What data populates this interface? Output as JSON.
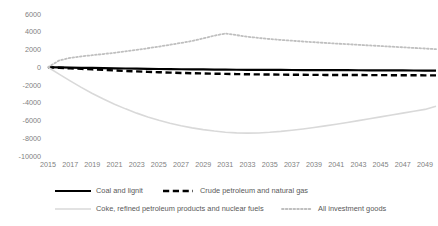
{
  "chart_data": {
    "type": "line",
    "title": "",
    "xlabel": "",
    "ylabel": "",
    "xlim": [
      2015,
      2050
    ],
    "ylim": [
      -10000,
      6000
    ],
    "grid": false,
    "legend_position": "bottom",
    "yticks": [
      6000,
      4000,
      2000,
      0,
      -2000,
      -4000,
      -6000,
      -8000,
      -10000
    ],
    "xticks": [
      2015,
      2017,
      2019,
      2021,
      2023,
      2025,
      2027,
      2029,
      2031,
      2033,
      2035,
      2037,
      2039,
      2041,
      2043,
      2045,
      2047,
      2049
    ],
    "x": [
      2015,
      2016,
      2017,
      2018,
      2019,
      2020,
      2021,
      2022,
      2023,
      2024,
      2025,
      2026,
      2027,
      2028,
      2029,
      2030,
      2031,
      2032,
      2033,
      2034,
      2035,
      2036,
      2037,
      2038,
      2039,
      2040,
      2041,
      2042,
      2043,
      2044,
      2045,
      2046,
      2047,
      2048,
      2049,
      2050
    ],
    "series": [
      {
        "name": "Coal and lignit",
        "style": "solid",
        "color": "#000000",
        "width": 2.2,
        "values": [
          0,
          -20,
          -40,
          -60,
          -80,
          -100,
          -120,
          -140,
          -160,
          -180,
          -195,
          -210,
          -225,
          -240,
          -250,
          -260,
          -270,
          -280,
          -290,
          -295,
          -300,
          -305,
          -310,
          -315,
          -320,
          -325,
          -330,
          -335,
          -340,
          -345,
          -350,
          -355,
          -360,
          -365,
          -370,
          -375
        ]
      },
      {
        "name": "Crude petroleum and natural gas",
        "style": "dashed",
        "color": "#000000",
        "width": 2.4,
        "values": [
          0,
          -60,
          -120,
          -180,
          -240,
          -300,
          -360,
          -420,
          -470,
          -520,
          -560,
          -600,
          -640,
          -670,
          -700,
          -725,
          -750,
          -770,
          -790,
          -805,
          -820,
          -830,
          -840,
          -850,
          -860,
          -865,
          -870,
          -875,
          -880,
          -885,
          -890,
          -895,
          -900,
          -905,
          -910,
          -915
        ]
      },
      {
        "name": "Coke, refined petroleum products and nuclear fuels",
        "style": "solid",
        "color": "#d9d9d9",
        "width": 1.6,
        "values": [
          0,
          -780,
          -1540,
          -2270,
          -2950,
          -3580,
          -4160,
          -4690,
          -5170,
          -5600,
          -5980,
          -6310,
          -6590,
          -6830,
          -7030,
          -7190,
          -7320,
          -7390,
          -7420,
          -7400,
          -7330,
          -7230,
          -7100,
          -6950,
          -6790,
          -6610,
          -6420,
          -6220,
          -6010,
          -5800,
          -5590,
          -5380,
          -5170,
          -4960,
          -4750,
          -4400
        ]
      },
      {
        "name": "All investment goods",
        "style": "dotted",
        "color": "#bfbfbf",
        "width": 1.8,
        "values": [
          0,
          760,
          1060,
          1220,
          1360,
          1490,
          1630,
          1790,
          1960,
          2140,
          2330,
          2530,
          2740,
          2960,
          3250,
          3560,
          3800,
          3620,
          3440,
          3300,
          3180,
          3080,
          2990,
          2900,
          2820,
          2740,
          2670,
          2600,
          2530,
          2460,
          2390,
          2320,
          2250,
          2180,
          2110,
          2040
        ]
      }
    ]
  },
  "legend": {
    "items": [
      {
        "label": "Coal and lignit",
        "style": "solid",
        "color": "#000000"
      },
      {
        "label": "Crude petroleum and natural gas",
        "style": "dashed",
        "color": "#000000"
      },
      {
        "label": "Coke, refined petroleum products and nuclear fuels",
        "style": "solid",
        "color": "#d9d9d9"
      },
      {
        "label": "All investment goods",
        "style": "dotted",
        "color": "#bfbfbf"
      }
    ]
  }
}
